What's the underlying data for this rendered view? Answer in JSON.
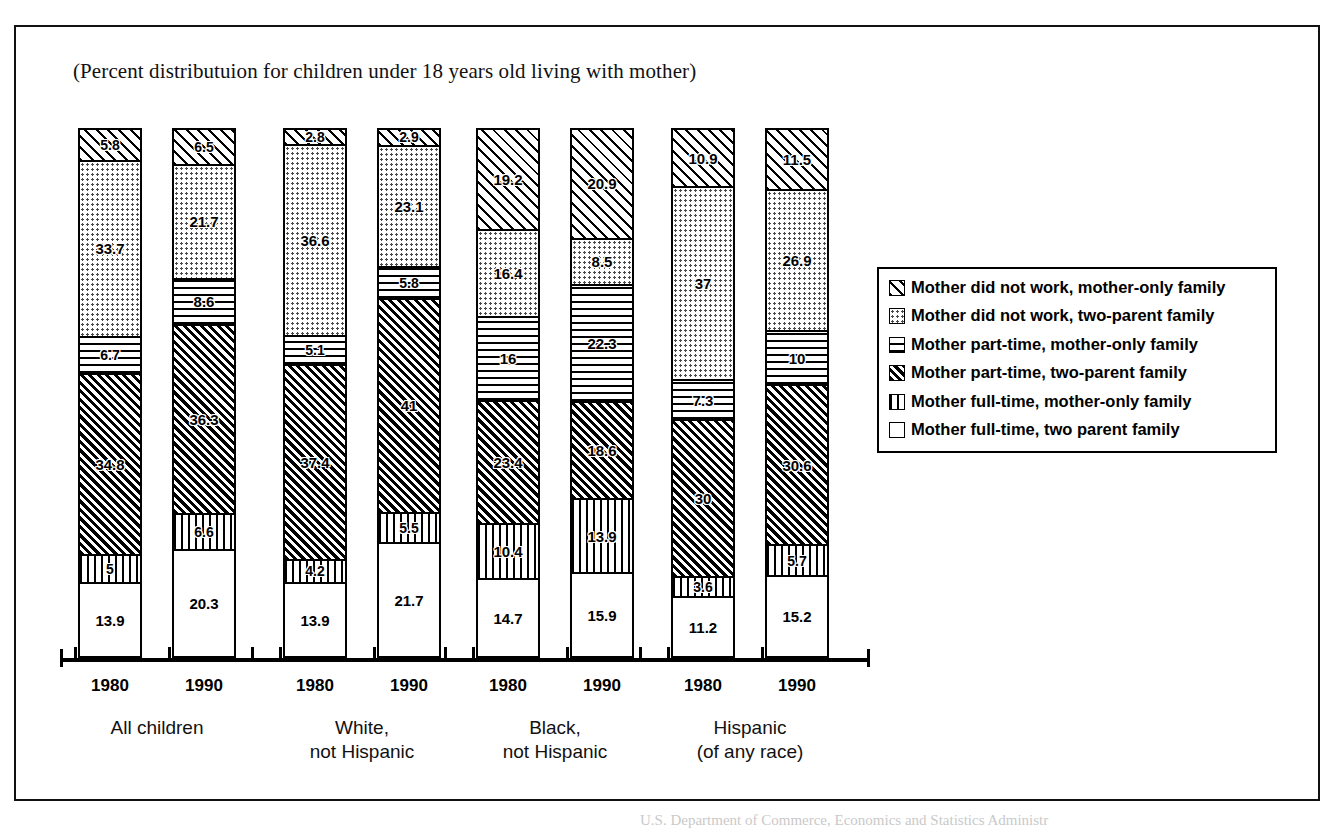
{
  "title": "(Percent distributuion for children under 18 years old living with mother)",
  "scan_footer": "U.S. Department of Commerce, Economics and Statistics Administr",
  "legend": {
    "items": [
      {
        "label": "Mother did not work, mother-only family",
        "pattern": "diagonal-up-hatch"
      },
      {
        "label": "Mother did not work, two-parent family",
        "pattern": "dots"
      },
      {
        "label": "Mother part-time, mother-only family",
        "pattern": "horizontal-lines"
      },
      {
        "label": "Mother part-time, two-parent family",
        "pattern": "dense-diagonal-hatch"
      },
      {
        "label": "Mother full-time, mother-only family",
        "pattern": "vertical-lines"
      },
      {
        "label": "Mother full-time, two parent family",
        "pattern": "blank"
      }
    ]
  },
  "chart_data": {
    "type": "bar",
    "subtype": "stacked-100-percent",
    "title": "(Percent distributuion for children under 18 years old living with mother)",
    "xlabel": "",
    "ylabel": "",
    "ylim": [
      0,
      100
    ],
    "grid": false,
    "legend_position": "right",
    "categories": [
      "All children 1980",
      "All children 1990",
      "White, not Hispanic 1980",
      "White, not Hispanic 1990",
      "Black, not Hispanic 1980",
      "Black, not Hispanic 1990",
      "Hispanic (of any race) 1980",
      "Hispanic (of any race) 1990"
    ],
    "groups": [
      {
        "name": "All children",
        "bars": [
          {
            "year": "1980",
            "segments": [
              {
                "series": "Mother full-time, two parent family",
                "value": 13.9,
                "label": "13.9"
              },
              {
                "series": "Mother full-time, mother-only family",
                "value": 5,
                "label": "5"
              },
              {
                "series": "Mother part-time, two-parent family",
                "value": 34.8,
                "label": "34.8"
              },
              {
                "series": "Mother part-time, mother-only family",
                "value": 6.7,
                "label": "6.7"
              },
              {
                "series": "Mother did not work, two-parent family",
                "value": 33.7,
                "label": "33.7"
              },
              {
                "series": "Mother did not work, mother-only family",
                "value": 5.8,
                "label": "5.8"
              }
            ]
          },
          {
            "year": "1990",
            "segments": [
              {
                "series": "Mother full-time, two parent family",
                "value": 20.3,
                "label": "20.3"
              },
              {
                "series": "Mother full-time, mother-only family",
                "value": 6.6,
                "label": "6.6"
              },
              {
                "series": "Mother part-time, two-parent family",
                "value": 36.3,
                "label": "36.3"
              },
              {
                "series": "Mother part-time, mother-only family",
                "value": 8.6,
                "label": "8.6"
              },
              {
                "series": "Mother did not work, two-parent family",
                "value": 21.7,
                "label": "21.7"
              },
              {
                "series": "Mother did not work, mother-only family",
                "value": 6.5,
                "label": "6.5"
              }
            ]
          }
        ]
      },
      {
        "name": "White,\nnot Hispanic",
        "bars": [
          {
            "year": "1980",
            "segments": [
              {
                "series": "Mother full-time, two parent family",
                "value": 13.9,
                "label": "13.9"
              },
              {
                "series": "Mother full-time, mother-only family",
                "value": 4.2,
                "label": "4.2"
              },
              {
                "series": "Mother part-time, two-parent family",
                "value": 37.4,
                "label": "37.4"
              },
              {
                "series": "Mother part-time, mother-only family",
                "value": 5.1,
                "label": "5.1"
              },
              {
                "series": "Mother did not work, two-parent family",
                "value": 36.6,
                "label": "36.6"
              },
              {
                "series": "Mother did not work, mother-only family",
                "value": 2.8,
                "label": "2.8"
              }
            ]
          },
          {
            "year": "1990",
            "segments": [
              {
                "series": "Mother full-time, two parent family",
                "value": 21.7,
                "label": "21.7"
              },
              {
                "series": "Mother full-time, mother-only family",
                "value": 5.5,
                "label": "5.5"
              },
              {
                "series": "Mother part-time, two-parent family",
                "value": 41,
                "label": "41"
              },
              {
                "series": "Mother part-time, mother-only family",
                "value": 5.8,
                "label": "5.8"
              },
              {
                "series": "Mother did not work, two-parent family",
                "value": 23.1,
                "label": "23.1"
              },
              {
                "series": "Mother did not work, mother-only family",
                "value": 2.9,
                "label": "2.9"
              }
            ]
          }
        ]
      },
      {
        "name": "Black,\nnot Hispanic",
        "bars": [
          {
            "year": "1980",
            "segments": [
              {
                "series": "Mother full-time, two parent family",
                "value": 14.7,
                "label": "14.7"
              },
              {
                "series": "Mother full-time, mother-only family",
                "value": 10.4,
                "label": "10.4"
              },
              {
                "series": "Mother part-time, two-parent family",
                "value": 23.4,
                "label": "23.4"
              },
              {
                "series": "Mother part-time, mother-only family",
                "value": 16,
                "label": "16"
              },
              {
                "series": "Mother did not work, two-parent family",
                "value": 16.4,
                "label": "16.4"
              },
              {
                "series": "Mother did not work, mother-only family",
                "value": 19.2,
                "label": "19.2"
              }
            ]
          },
          {
            "year": "1990",
            "segments": [
              {
                "series": "Mother full-time, two parent family",
                "value": 15.9,
                "label": "15.9"
              },
              {
                "series": "Mother full-time, mother-only family",
                "value": 13.9,
                "label": "13.9"
              },
              {
                "series": "Mother part-time, two-parent family",
                "value": 18.6,
                "label": "18.6"
              },
              {
                "series": "Mother part-time, mother-only family",
                "value": 22.3,
                "label": "22.3"
              },
              {
                "series": "Mother did not work, two-parent family",
                "value": 8.5,
                "label": "8.5"
              },
              {
                "series": "Mother did not work, mother-only family",
                "value": 20.9,
                "label": "20.9"
              }
            ]
          }
        ]
      },
      {
        "name": "Hispanic\n(of any race)",
        "bars": [
          {
            "year": "1980",
            "segments": [
              {
                "series": "Mother full-time, two parent family",
                "value": 11.2,
                "label": "11.2"
              },
              {
                "series": "Mother full-time, mother-only family",
                "value": 3.6,
                "label": "3.6"
              },
              {
                "series": "Mother part-time, two-parent family",
                "value": 30,
                "label": "30"
              },
              {
                "series": "Mother part-time, mother-only family",
                "value": 7.3,
                "label": "7.3"
              },
              {
                "series": "Mother did not work, two-parent family",
                "value": 37,
                "label": "37"
              },
              {
                "series": "Mother did not work, mother-only family",
                "value": 10.9,
                "label": "10.9"
              }
            ]
          },
          {
            "year": "1990",
            "segments": [
              {
                "series": "Mother full-time, two parent family",
                "value": 15.2,
                "label": "15.2"
              },
              {
                "series": "Mother full-time, mother-only family",
                "value": 5.7,
                "label": "5.7"
              },
              {
                "series": "Mother part-time, two-parent family",
                "value": 30.6,
                "label": "30.6"
              },
              {
                "series": "Mother part-time, mother-only family",
                "value": 10,
                "label": "10"
              },
              {
                "series": "Mother did not work, two-parent family",
                "value": 26.9,
                "label": "26.9"
              },
              {
                "series": "Mother did not work, mother-only family",
                "value": 11.5,
                "label": "11.5"
              }
            ]
          }
        ]
      }
    ]
  }
}
